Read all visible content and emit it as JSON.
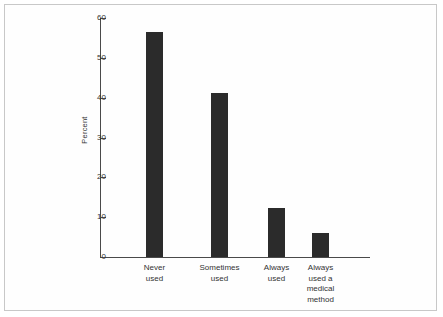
{
  "chart_data": {
    "type": "bar",
    "title": "",
    "subtitle": "",
    "xlabel": "",
    "ylabel": "Percent",
    "ylim": [
      0,
      60
    ],
    "yticks": [
      0,
      10,
      20,
      30,
      40,
      50,
      60
    ],
    "ytick_labels": [
      "0",
      "10",
      "20",
      "30",
      "40",
      "50",
      "60"
    ],
    "grid": false,
    "legend": null,
    "categories": [
      "Never\nused",
      "Sometimes\nused",
      "Always\nused",
      "Always\nused a\nmedical\nmethod"
    ],
    "category_labels_flat": [
      "Never used",
      "Sometimes used",
      "Always used",
      "Always used a medical method"
    ],
    "values": [
      56.5,
      41.3,
      12.4,
      6.0
    ],
    "bar_color": "#2b2b2b",
    "axis_color": "#4a4a4a",
    "background_color": "#ffffff",
    "frame_color": "#c8c8c8"
  }
}
